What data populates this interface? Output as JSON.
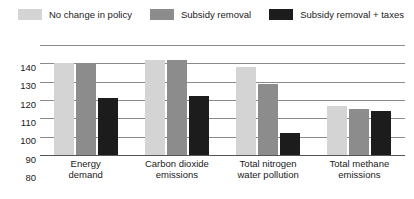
{
  "chart_data": {
    "type": "bar",
    "title": "",
    "xlabel": "",
    "ylabel": "",
    "ylim": [
      80,
      140
    ],
    "yticks": [
      140,
      130,
      120,
      110,
      100,
      90,
      80
    ],
    "grid": true,
    "legend_position": "top-left",
    "categories": [
      "Energy demand",
      "Carbon dioxide emissions",
      "Total nitrogen water pollution",
      "Total methane emissions"
    ],
    "category_lines": [
      [
        "Energy",
        "demand"
      ],
      [
        "Carbon dioxide",
        "emissions"
      ],
      [
        "Total nitrogen",
        "water pollution"
      ],
      [
        "Total methane",
        "emissions"
      ]
    ],
    "series": [
      {
        "name": "No change in policy",
        "color": "#d4d4d4",
        "values": [
          130,
          132,
          128,
          107
        ]
      },
      {
        "name": "Subsidy removal",
        "color": "#8c8c8c",
        "values": [
          130,
          132,
          119,
          105
        ]
      },
      {
        "name": "Subsidy removal + taxes",
        "color": "#1c1c1c",
        "values": [
          111,
          112,
          92,
          104
        ]
      }
    ]
  },
  "legend": {
    "items": [
      {
        "label": "No change in policy",
        "color": "#d4d4d4",
        "icon": "legend-swatch-icon"
      },
      {
        "label": "Subsidy removal",
        "color": "#8c8c8c",
        "icon": "legend-swatch-icon"
      },
      {
        "label": "Subsidy removal + taxes",
        "color": "#1c1c1c",
        "icon": "legend-swatch-icon"
      }
    ]
  },
  "axis": {
    "y_tick_labels": [
      "140",
      "130",
      "120",
      "110",
      "100",
      "90",
      "80"
    ]
  },
  "colors": {
    "gridline": "#8a8a8a",
    "baseline": "#555555",
    "text": "#1a1a1a",
    "background": "#ffffff"
  }
}
